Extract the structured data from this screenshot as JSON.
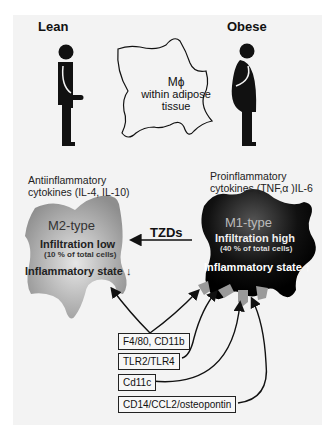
{
  "figure": {
    "lean_label": "Lean",
    "obese_label": "Obese",
    "macrophage": {
      "symbol": "Mϕ",
      "caption_line1": "within adipose",
      "caption_line2": "tissue"
    },
    "m2": {
      "cytokines_line1": "Antiinflammatory",
      "cytokines_line2": "cytokines (IL-4, IL-10)",
      "type": "M2-type",
      "infiltration": "Infiltration low",
      "percent": "(10 % of total cells)",
      "state": "Inflammatory state",
      "state_arrow": "↓",
      "fill": "#9a9a9a"
    },
    "m1": {
      "cytokines_line1": "Proinflammatory",
      "cytokines_line2": "cytokines (TNF,α )IL-6",
      "type": "M1-type",
      "infiltration": "Infiltration high",
      "percent": "(40 % of total cells)",
      "state": "Inflammatory state",
      "state_arrow": "↑",
      "fill": "#111111"
    },
    "tzds_label": "TZDs",
    "markers": [
      {
        "label": "F4/80, CD11b"
      },
      {
        "label": "TLR2/TLR4"
      },
      {
        "label": "Cd11c"
      },
      {
        "label": "CD14/CCL2/osteopontin"
      }
    ]
  }
}
